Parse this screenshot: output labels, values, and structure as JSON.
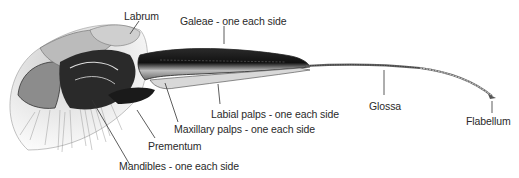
{
  "diagram": {
    "style": "monochrome pen-and-ink illustration",
    "colors": {
      "ink": "#1a1a1a",
      "label_text": "#2a2a2a",
      "background": "#ffffff"
    },
    "labels": [
      {
        "id": "labrum",
        "text": "Labrum"
      },
      {
        "id": "galeae",
        "text": "Galeae - one each side"
      },
      {
        "id": "labial_palps",
        "text": "Labial palps - one each side"
      },
      {
        "id": "glossa",
        "text": "Glossa"
      },
      {
        "id": "flabellum",
        "text": "Flabellum"
      },
      {
        "id": "maxillary_palps",
        "text": "Maxillary palps - one each side"
      },
      {
        "id": "prementum",
        "text": "Prementum"
      },
      {
        "id": "mandibles",
        "text": "Mandibles - one each side"
      }
    ]
  }
}
